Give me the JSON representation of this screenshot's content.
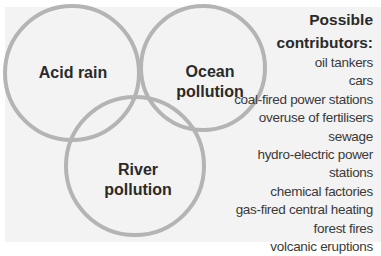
{
  "circles": [
    {
      "id": "acid-rain",
      "label": "Acid rain",
      "cx": 72,
      "cy": 73,
      "r": 68
    },
    {
      "id": "ocean-pollution",
      "label_lines": [
        "Ocean",
        "pollution"
      ],
      "cx": 203,
      "cy": 68,
      "r": 63
    },
    {
      "id": "river-pollution",
      "label_lines": [
        "River",
        "pollution"
      ],
      "cx": 135,
      "cy": 166,
      "r": 70
    }
  ],
  "labels": {
    "acid_rain": "Acid rain",
    "ocean_line1": "Ocean",
    "ocean_line2": "pollution",
    "river_line1": "River",
    "river_line2": "pollution"
  },
  "legend": {
    "title_line1": "Possible",
    "title_line2": "contributors:",
    "items": [
      "oil tankers",
      "cars",
      "coal-fired power stations",
      "overuse of fertilisers",
      "sewage",
      "hydro-electric power",
      "stations",
      "chemical factories",
      "gas-fired central heating",
      "forest fires",
      "volcanic eruptions"
    ]
  },
  "colors": {
    "circle_stroke": "#b4b4b4",
    "panel_bg": "#f3f3f3",
    "text_dark": "#2a2a2a"
  }
}
